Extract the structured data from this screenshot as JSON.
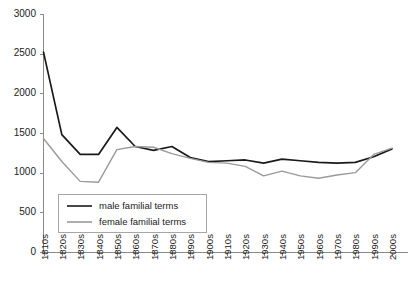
{
  "chart_data": {
    "type": "line",
    "title": "",
    "subtitle": "",
    "xlabel": "",
    "ylabel": "",
    "xlim_categories": 20,
    "ylim": [
      0,
      3000
    ],
    "y_ticks": [
      0,
      500,
      1000,
      1500,
      2000,
      2500,
      3000
    ],
    "grid": false,
    "legend_position": "inside-bottom-left",
    "categories": [
      "1810s",
      "1820s",
      "1830s",
      "1840s",
      "1850s",
      "1860s",
      "1870s",
      "1880s",
      "1890s",
      "1900s",
      "1910s",
      "1920s",
      "1930s",
      "1940s",
      "1950s",
      "1960s",
      "1970s",
      "1980s",
      "1990s",
      "2000s"
    ],
    "series": [
      {
        "name": "male familial terms",
        "color": "#1a1a1a",
        "values": [
          2520,
          1480,
          1230,
          1230,
          1570,
          1330,
          1280,
          1330,
          1190,
          1140,
          1150,
          1160,
          1120,
          1170,
          1150,
          1130,
          1120,
          1130,
          1200,
          1300
        ]
      },
      {
        "name": "female familial terms",
        "color": "#9a9a9a",
        "values": [
          1430,
          1140,
          890,
          880,
          1290,
          1330,
          1320,
          1240,
          1180,
          1130,
          1120,
          1080,
          960,
          1020,
          960,
          930,
          970,
          1000,
          1230,
          1310
        ]
      }
    ]
  },
  "legend": {
    "entries": [
      {
        "label": "male familial terms",
        "color": "#1a1a1a"
      },
      {
        "label": "female familial terms",
        "color": "#9a9a9a"
      }
    ]
  },
  "axes": {
    "y_tick_labels": [
      "0",
      "500",
      "1000",
      "1500",
      "2000",
      "2500",
      "3000"
    ],
    "x_tick_labels": [
      "1810s",
      "1820s",
      "1830s",
      "1840s",
      "1850s",
      "1860s",
      "1870s",
      "1880s",
      "1890s",
      "1900s",
      "1910s",
      "1920s",
      "1930s",
      "1940s",
      "1950s",
      "1960s",
      "1970s",
      "1980s",
      "1990s",
      "2000s"
    ]
  }
}
